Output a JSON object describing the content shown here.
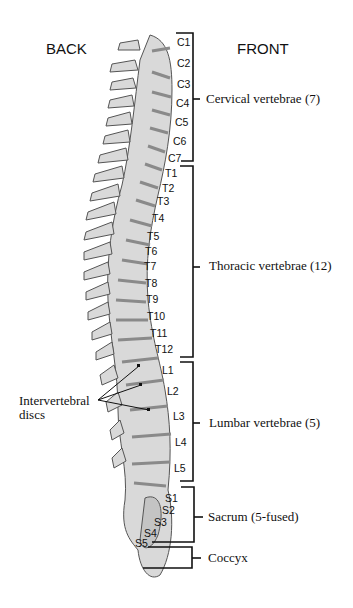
{
  "headers": {
    "back": "BACK",
    "front": "FRONT"
  },
  "colors": {
    "bone": "#d9d9d9",
    "outline": "#555555",
    "disc": "#8a8a8a",
    "bracket": "#111111",
    "background": "#ffffff"
  },
  "regions": [
    {
      "id": "cervical",
      "label": "Cervical vertebrae (7)",
      "vertebrae": [
        "C1",
        "C2",
        "C3",
        "C4",
        "C5",
        "C6",
        "C7"
      ]
    },
    {
      "id": "thoracic",
      "label": "Thoracic vertebrae (12)",
      "vertebrae": [
        "T1",
        "T2",
        "T3",
        "T4",
        "T5",
        "T6",
        "T7",
        "T8",
        "T9",
        "T10",
        "T11",
        "T12"
      ]
    },
    {
      "id": "lumbar",
      "label": "Lumbar vertebrae (5)",
      "vertebrae": [
        "L1",
        "L2",
        "L3",
        "L4",
        "L5"
      ]
    },
    {
      "id": "sacrum",
      "label": "Sacrum (5-fused)",
      "vertebrae": [
        "S1",
        "S2",
        "S3",
        "S4",
        "S5"
      ]
    },
    {
      "id": "coccyx",
      "label": "Coccyx",
      "vertebrae": []
    }
  ],
  "callout": {
    "line1": "Intervertebral",
    "line2": "discs"
  }
}
